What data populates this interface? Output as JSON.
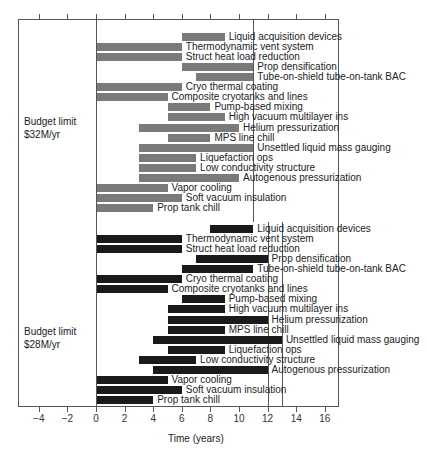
{
  "chart_data": {
    "type": "bar",
    "subtype": "gantt",
    "xlabel": "Time (years)",
    "ylabel": "",
    "xlim": [
      -5.5,
      17
    ],
    "xticks": [
      -4,
      -2,
      0,
      2,
      4,
      6,
      8,
      10,
      12,
      14,
      16
    ],
    "grid": false,
    "legend": null,
    "panels": [
      {
        "name": "Budget limit $32M/yr",
        "label_lines": [
          "Budget limit",
          "$32M/yr"
        ],
        "bar_color": "#7a7a7a",
        "reference_lines": [
          11
        ],
        "tasks": [
          {
            "name": "Liquid acquisition devices",
            "start": 6,
            "end": 9
          },
          {
            "name": "Thermodynamic vent system",
            "start": 0,
            "end": 6
          },
          {
            "name": "Struct heat load reduction",
            "start": 0,
            "end": 6
          },
          {
            "name": "Prop densification",
            "start": 6,
            "end": 11
          },
          {
            "name": "Tube-on-shield tube-on-tank BAC",
            "start": 7,
            "end": 11
          },
          {
            "name": "Cryo thermal coating",
            "start": 0,
            "end": 6
          },
          {
            "name": "Composite cryotanks and lines",
            "start": 0,
            "end": 5
          },
          {
            "name": "Pump-based mixing",
            "start": 5,
            "end": 8
          },
          {
            "name": "High vacuum multilayer ins",
            "start": 5,
            "end": 9
          },
          {
            "name": "Helium pressurization",
            "start": 3,
            "end": 10
          },
          {
            "name": "MPS line chill",
            "start": 5,
            "end": 8
          },
          {
            "name": "Unsettled liquid mass gauging",
            "start": 3,
            "end": 11
          },
          {
            "name": "Liquefaction ops",
            "start": 3,
            "end": 7
          },
          {
            "name": "Low conductivity structure",
            "start": 3,
            "end": 7
          },
          {
            "name": "Autogenous pressurization",
            "start": 3,
            "end": 10
          },
          {
            "name": "Vapor cooling",
            "start": 0,
            "end": 5
          },
          {
            "name": "Soft vacuum insulation",
            "start": 0,
            "end": 6
          },
          {
            "name": "Prop tank chill",
            "start": 0,
            "end": 4
          }
        ]
      },
      {
        "name": "Budget limit $28M/yr",
        "label_lines": [
          "Budget limit",
          "$28M/yr"
        ],
        "bar_color": "#1a1a1a",
        "reference_lines": [
          12,
          13
        ],
        "tasks": [
          {
            "name": "Liquid acquisition devices",
            "start": 8,
            "end": 11
          },
          {
            "name": "Thermodynamic vent system",
            "start": 0,
            "end": 6
          },
          {
            "name": "Struct heat load reduction",
            "start": 0,
            "end": 6
          },
          {
            "name": "Prop densification",
            "start": 7,
            "end": 12
          },
          {
            "name": "Tube-on-shield tube-on-tank BAC",
            "start": 6,
            "end": 11
          },
          {
            "name": "Cryo thermal coating",
            "start": 0,
            "end": 6
          },
          {
            "name": "Composite cryotanks and lines",
            "start": 0,
            "end": 5
          },
          {
            "name": "Pump-based mixing",
            "start": 6,
            "end": 9
          },
          {
            "name": "High vacuum multilayer ins",
            "start": 5,
            "end": 9
          },
          {
            "name": "Helium pressurization",
            "start": 5,
            "end": 12
          },
          {
            "name": "MPS line chill",
            "start": 5,
            "end": 9
          },
          {
            "name": "Unsettled liquid mass gauging",
            "start": 4,
            "end": 13
          },
          {
            "name": "Liquefaction ops",
            "start": 5,
            "end": 9
          },
          {
            "name": "Low conductivity structure",
            "start": 3,
            "end": 7
          },
          {
            "name": "Autogenous pressurization",
            "start": 4,
            "end": 12
          },
          {
            "name": "Vapor cooling",
            "start": 0,
            "end": 5
          },
          {
            "name": "Soft vacuum insulation",
            "start": 0,
            "end": 6
          },
          {
            "name": "Prop tank chill",
            "start": 0,
            "end": 4
          }
        ]
      }
    ]
  }
}
